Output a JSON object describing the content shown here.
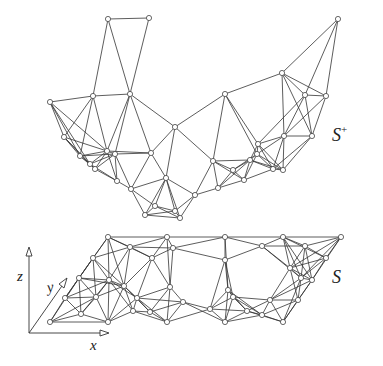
{
  "figure": {
    "labels": {
      "lifted_surface": "S",
      "lifted_surface_sup": "+",
      "planar_mesh": "S",
      "axis_x": "x",
      "axis_y": "y",
      "axis_z": "z"
    },
    "colors": {
      "edge": "#333333",
      "node_fill": "#ffffff",
      "node_stroke": "#444444",
      "background": "#ffffff"
    },
    "upper_nodes": [
      [
        108,
        19
      ],
      [
        149,
        18
      ],
      [
        338,
        19
      ],
      [
        50,
        102
      ],
      [
        93,
        96
      ],
      [
        130,
        94
      ],
      [
        225,
        94
      ],
      [
        282,
        73
      ],
      [
        305,
        95
      ],
      [
        326,
        96
      ],
      [
        64,
        137
      ],
      [
        107,
        151
      ],
      [
        115,
        154
      ],
      [
        151,
        153
      ],
      [
        175,
        127
      ],
      [
        213,
        161
      ],
      [
        258,
        144
      ],
      [
        284,
        136
      ],
      [
        312,
        136
      ],
      [
        90,
        164
      ],
      [
        95,
        169
      ],
      [
        117,
        181
      ],
      [
        131,
        189
      ],
      [
        166,
        178
      ],
      [
        218,
        188
      ],
      [
        244,
        180
      ],
      [
        273,
        169
      ],
      [
        283,
        170
      ],
      [
        145,
        215
      ],
      [
        155,
        206
      ],
      [
        175,
        211
      ],
      [
        180,
        218
      ],
      [
        195,
        195
      ],
      [
        233,
        170
      ],
      [
        250,
        160
      ],
      [
        257,
        154
      ],
      [
        80,
        156
      ]
    ],
    "lower_nodes": [
      [
        108,
        237
      ],
      [
        167,
        237
      ],
      [
        225,
        237
      ],
      [
        283,
        237
      ],
      [
        341,
        237
      ],
      [
        130,
        247
      ],
      [
        173,
        248
      ],
      [
        262,
        246
      ],
      [
        305,
        246
      ],
      [
        326,
        258
      ],
      [
        93,
        258
      ],
      [
        152,
        258
      ],
      [
        225,
        260
      ],
      [
        290,
        268
      ],
      [
        79,
        278
      ],
      [
        109,
        280
      ],
      [
        124,
        286
      ],
      [
        170,
        287
      ],
      [
        228,
        290
      ],
      [
        301,
        278
      ],
      [
        312,
        280
      ],
      [
        65,
        298
      ],
      [
        96,
        297
      ],
      [
        137,
        298
      ],
      [
        183,
        302
      ],
      [
        233,
        297
      ],
      [
        270,
        300
      ],
      [
        298,
        300
      ],
      [
        50,
        322
      ],
      [
        108,
        322
      ],
      [
        167,
        322
      ],
      [
        225,
        322
      ],
      [
        283,
        322
      ],
      [
        81,
        314
      ],
      [
        133,
        311
      ],
      [
        150,
        312
      ],
      [
        210,
        309
      ],
      [
        262,
        315
      ],
      [
        247,
        311
      ]
    ]
  }
}
